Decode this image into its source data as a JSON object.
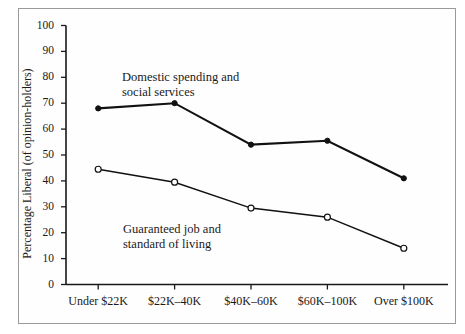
{
  "figure": {
    "background_color": "#ffffff",
    "border_color": "#9a9a9a",
    "axis_color": "#1a1a1a"
  },
  "axes": {
    "y_title": "Percentage Liberal (of opinion-holders)",
    "y_ticks": [
      "0",
      "10",
      "20",
      "30",
      "40",
      "50",
      "60",
      "70",
      "80",
      "90",
      "100"
    ],
    "x_ticks": [
      "Under $22K",
      "$22K–40K",
      "$40K–60K",
      "$60K–100K",
      "Over $100K"
    ]
  },
  "annotations": {
    "domestic_line1": "Domestic spending and",
    "domestic_line2": "social services",
    "guaranteed_line1": "Guaranteed job and",
    "guaranteed_line2": "standard of living"
  },
  "chart_data": {
    "type": "line",
    "title": "",
    "xlabel": "",
    "ylabel": "Percentage Liberal (of opinion-holders)",
    "categories": [
      "Under $22K",
      "$22K–40K",
      "$40K–60K",
      "$60K–100K",
      "Over $100K"
    ],
    "ylim": [
      0,
      100
    ],
    "ytick_step": 10,
    "grid": false,
    "legend": "inline-annotations",
    "series": [
      {
        "name": "Domestic spending and social services",
        "values": [
          68,
          70,
          54,
          55.5,
          41
        ],
        "marker": "filled-circle",
        "color": "#111111"
      },
      {
        "name": "Guaranteed job and standard of living",
        "values": [
          44.5,
          39.5,
          29.5,
          26,
          14
        ],
        "marker": "open-circle",
        "color": "#111111"
      }
    ]
  }
}
